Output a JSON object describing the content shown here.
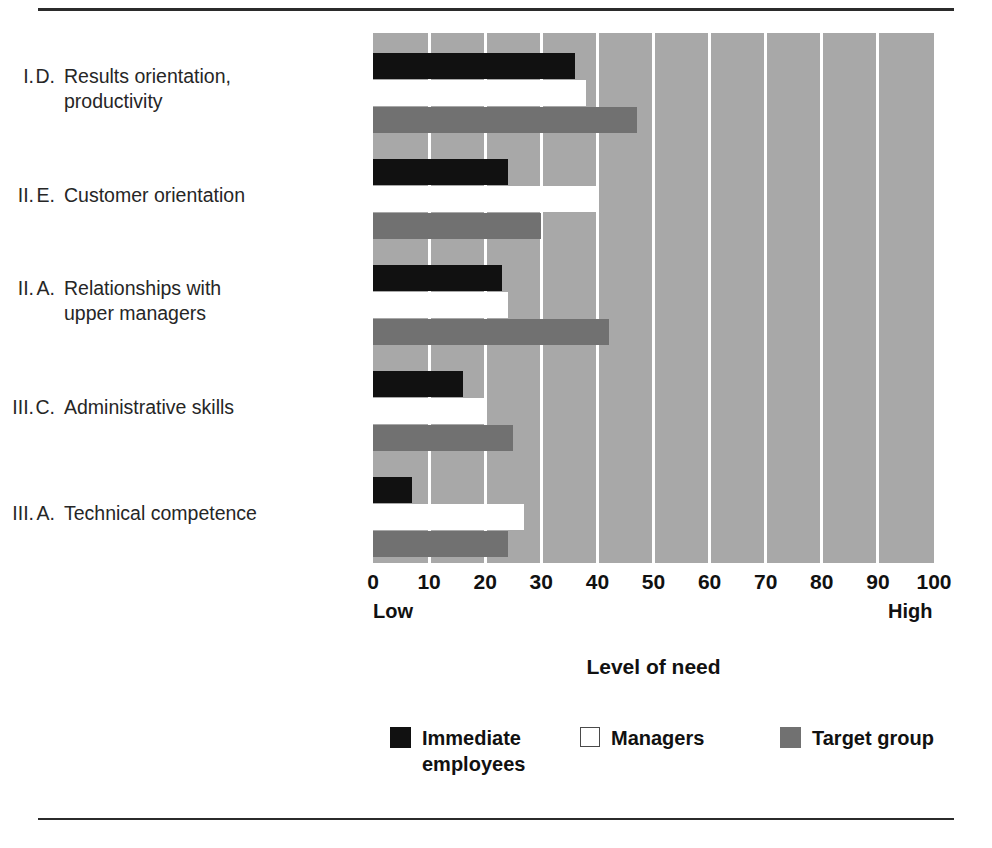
{
  "chart_data": {
    "type": "bar",
    "orientation": "horizontal",
    "title": "",
    "xlabel": "Level of need",
    "ylabel": "",
    "xlim": [
      0,
      100
    ],
    "xticks": [
      0,
      10,
      20,
      30,
      40,
      50,
      60,
      70,
      80,
      90,
      100
    ],
    "xtick_labels": [
      "0",
      "10",
      "20",
      "30",
      "40",
      "50",
      "60",
      "70",
      "80",
      "90",
      "100"
    ],
    "axis_endpoint_low": "Low",
    "axis_endpoint_high": "High",
    "grid": true,
    "legend_position": "bottom",
    "categories": [
      {
        "numeral": "I.",
        "letter": "D.",
        "text_line1": "Results orientation,",
        "text_line2": "productivity"
      },
      {
        "numeral": "II.",
        "letter": "E.",
        "text_line1": "Customer orientation",
        "text_line2": ""
      },
      {
        "numeral": "II.",
        "letter": "A.",
        "text_line1": "Relationships with",
        "text_line2": "upper managers"
      },
      {
        "numeral": "III.",
        "letter": "C.",
        "text_line1": "Administrative skills",
        "text_line2": ""
      },
      {
        "numeral": "III.",
        "letter": "A.",
        "text_line1": "Technical competence",
        "text_line2": ""
      }
    ],
    "series": [
      {
        "name": "Immediate employees",
        "color": "#111111",
        "values": [
          36,
          24,
          23,
          16,
          7
        ]
      },
      {
        "name": "Managers",
        "color": "#ffffff",
        "values": [
          38,
          40,
          24,
          20,
          27
        ]
      },
      {
        "name": "Target group",
        "color": "#717171",
        "values": [
          47,
          30,
          42,
          25,
          24
        ]
      }
    ]
  },
  "legend": {
    "items": [
      {
        "label_line1": "Immediate",
        "label_line2": "employees"
      },
      {
        "label_line1": "Managers",
        "label_line2": ""
      },
      {
        "label_line1": "Target group",
        "label_line2": ""
      }
    ]
  },
  "colors": {
    "plot_background": "#a8a8a8",
    "gridline": "#ffffff",
    "immediate_employees": "#111111",
    "managers": "#ffffff",
    "target_group": "#717171",
    "rule": "#2b2b2b"
  }
}
